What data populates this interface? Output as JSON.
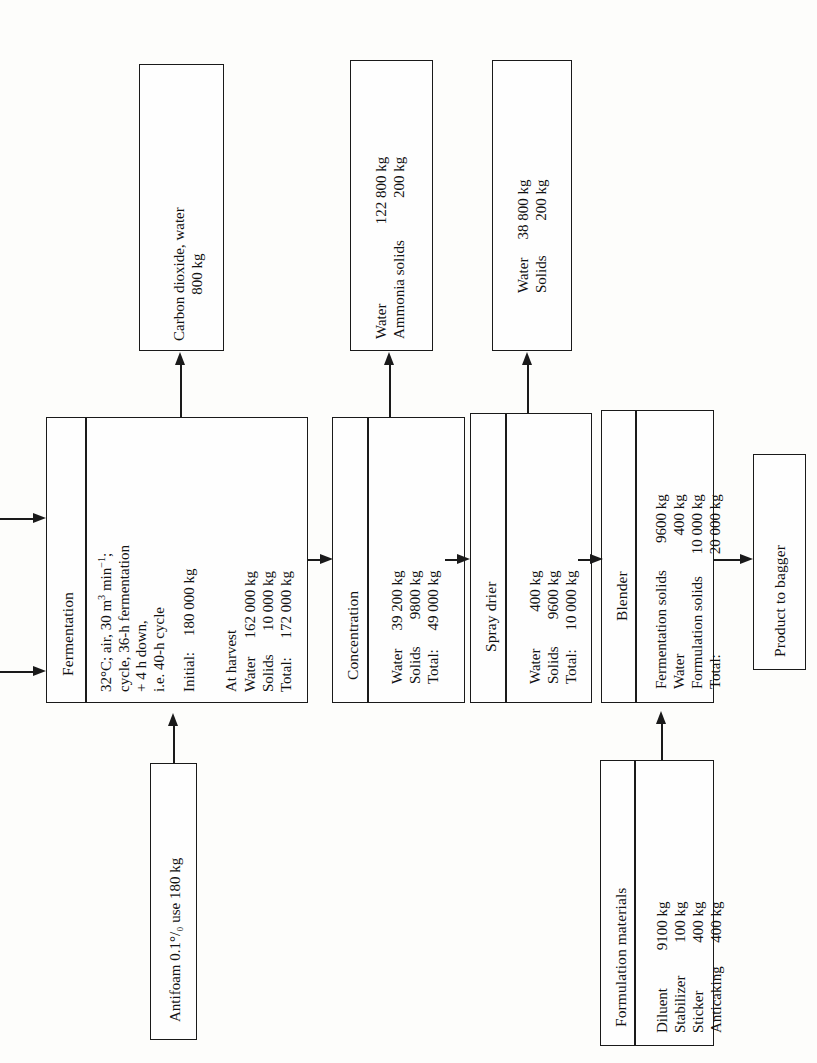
{
  "diagram": {
    "type": "process-flow-diagram",
    "orientation": "rotated-90-counterclockwise",
    "line_color": "#1a1a1a",
    "background_color": "#fdfdfb"
  },
  "process_boxes": {
    "fermentation": {
      "name": "Fermentation",
      "conditions": [
        "32°C; air, 30 m3 min −1;",
        "cycle, 36-h fermentation",
        "+ 4 h down,",
        "i.e. 40-h cycle"
      ],
      "condition_line1_pre": "32",
      "condition_line1_mid": "C; air, 30 m",
      "condition_line1_sup": "3",
      "condition_line1_post": " min",
      "condition_line1_sup2": "−1",
      "condition_line1_end": ";",
      "condition_line2": "cycle, 36-h fermentation",
      "condition_line3": "+ 4 h down,",
      "condition_line4": "i.e. 40-h cycle",
      "initial_label": "Initial:",
      "initial_value": "180 000 kg",
      "at_harvest_label": "At harvest",
      "rows": [
        {
          "label": "Water",
          "value": "162 000 kg"
        },
        {
          "label": "Solids",
          "value": "10 000 kg"
        },
        {
          "label": "Total:",
          "value": "172 000 kg"
        }
      ]
    },
    "concentration": {
      "name": "Concentration",
      "rows": [
        {
          "label": "Water",
          "value": "39 200 kg"
        },
        {
          "label": "Solids",
          "value": "9800 kg"
        },
        {
          "label": "Total:",
          "value": "49 000 kg"
        }
      ]
    },
    "spray_drier": {
      "name": "Spray drier",
      "rows": [
        {
          "label": "Water",
          "value": "400 kg"
        },
        {
          "label": "Solids",
          "value": "9600 kg"
        },
        {
          "label": "Total:",
          "value": "10 000 kg"
        }
      ]
    },
    "blender": {
      "name": "Blender",
      "rows": [
        {
          "label": "Fermentation solids",
          "value": "9600 kg"
        },
        {
          "label": "Water",
          "value": "400 kg"
        },
        {
          "label": "Formulation solids",
          "value": "10 000 kg"
        },
        {
          "label": "Total:",
          "value": "20 000 kg"
        }
      ]
    }
  },
  "output_boxes": {
    "fermentation_offgas": {
      "line1": "Carbon dioxide, water",
      "line2": "800 kg"
    },
    "concentration_vapour": {
      "rows": [
        {
          "label": "Water",
          "value": "122 800 kg"
        },
        {
          "label": "Ammonia solids",
          "value": "200 kg"
        }
      ]
    },
    "drier_exhaust": {
      "rows": [
        {
          "label": "Water",
          "value": "38 800 kg"
        },
        {
          "label": "Solids",
          "value": "200 kg"
        }
      ]
    },
    "product": {
      "name": "Product to bagger"
    }
  },
  "input_boxes": {
    "antifoam": {
      "text_pre": "Antifoam 0.1",
      "text_percent": "°/₀₀",
      "text_post": " use 180 kg",
      "full_text": "Antifoam 0.1% use 180 kg"
    },
    "formulation_materials": {
      "name": "Formulation materials",
      "rows": [
        {
          "label": "Diluent",
          "value": "9100 kg"
        },
        {
          "label": "Stabilizer",
          "value": "100 kg"
        },
        {
          "label": "Sticker",
          "value": "400 kg"
        },
        {
          "label": "Anticaking",
          "value": "400 kg"
        }
      ]
    }
  },
  "connectors": {
    "feed_arrow_top": "medium / inoculum feed into fermentation",
    "feed_arrow_bottom": "medium / inoculum feed into fermentation",
    "fermentation_to_offgas": "vent to carbon dioxide, water",
    "fermentation_to_concentration": "broth to concentration",
    "concentration_to_vapour": "vapour to water / ammonia solids",
    "concentration_to_spray_drier": "concentrate to spray drier",
    "spray_drier_to_exhaust": "exhaust to water / solids",
    "spray_drier_to_blender": "dried solids to blender",
    "blender_to_product": "blend to product to bagger",
    "antifoam_to_fermentation": "antifoam into fermentation",
    "formulation_to_blender": "formulation materials into blender"
  }
}
